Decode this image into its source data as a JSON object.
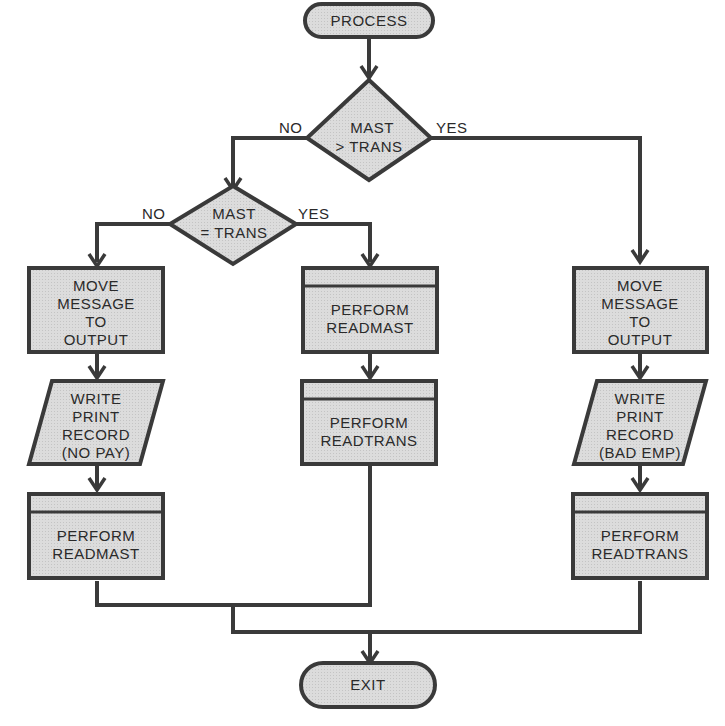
{
  "colors": {
    "fill": "#d9d9d9",
    "stroke": "#3a3a3a",
    "text": "#2a2a2a",
    "background": "#ffffff"
  },
  "nodes": {
    "start": {
      "shape": "terminator",
      "label": "PROCESS"
    },
    "decision1": {
      "shape": "decision",
      "line1": "MAST",
      "line2": "> TRANS",
      "no_label": "NO",
      "yes_label": "YES"
    },
    "decision2": {
      "shape": "decision",
      "line1": "MAST",
      "line2": "= TRANS",
      "no_label": "NO",
      "yes_label": "YES"
    },
    "left_move": {
      "shape": "process",
      "lines": [
        "MOVE",
        "MESSAGE",
        "TO",
        "OUTPUT"
      ]
    },
    "left_write": {
      "shape": "io",
      "lines": [
        "WRITE",
        "PRINT",
        "RECORD",
        "(NO PAY)"
      ]
    },
    "left_perform": {
      "shape": "predefined",
      "lines": [
        "PERFORM",
        "READMAST"
      ]
    },
    "mid_perform1": {
      "shape": "predefined",
      "lines": [
        "PERFORM",
        "READMAST"
      ]
    },
    "mid_perform2": {
      "shape": "predefined",
      "lines": [
        "PERFORM",
        "READTRANS"
      ]
    },
    "right_move": {
      "shape": "process",
      "lines": [
        "MOVE",
        "MESSAGE",
        "TO",
        "OUTPUT"
      ]
    },
    "right_write": {
      "shape": "io",
      "lines": [
        "WRITE",
        "PRINT",
        "RECORD",
        "(BAD EMP)"
      ]
    },
    "right_perform": {
      "shape": "predefined",
      "lines": [
        "PERFORM",
        "READTRANS"
      ]
    },
    "end": {
      "shape": "terminator",
      "label": "EXIT"
    }
  }
}
